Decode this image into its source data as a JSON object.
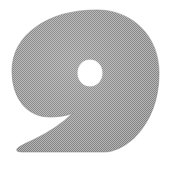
{
  "image": {
    "title": "Scanned comma glyph",
    "width": 172,
    "height": 169,
    "background_color": "#ffffff",
    "alt_text": "Large gray halftone-textured comma or nine-shaped glyph"
  },
  "glyph": {
    "name": "comma-glyph",
    "character": "9",
    "description": "Bold rounded bowl with small circular counter and a tail sweeping down to the lower left ending in a flat horizontal baseline",
    "fill_color": "#9a9a9a",
    "fill_color_light": "#b4b4b4",
    "fill_color_dark": "#858585",
    "texture": "dithered-halftone-checkerboard",
    "counter": {
      "name": "counter-hole",
      "color": "#ffffff",
      "center_x": 90,
      "center_y": 73,
      "radius_x": 12,
      "radius_y": 13
    },
    "bounds": {
      "left": 12,
      "top": 10,
      "right": 159,
      "bottom": 152
    },
    "outline_path": "M 97 10 C 132 10 159 36 159 73 C 159 101 150 122 134 138 C 124 147 113 152 104 152 L 22 152 C 18 152 16 151 17 149 C 18 147 24 144 33 140 C 48 133 62 124 73 113 C 66 116 58 117 50 117 C 27 117 12 98 12 71 C 12 36 46 10 97 10 Z",
    "counter_path": "M 90 60 C 97 60 102 66 102 73 C 102 80 97 86 90 86 C 83 86 78 80 78 73 C 78 66 83 60 90 60 Z"
  }
}
